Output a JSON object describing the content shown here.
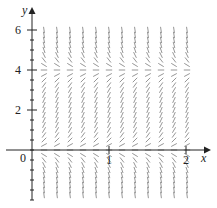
{
  "diagram": {
    "type": "slope-field",
    "axes": {
      "x_label": "x",
      "y_label": "y",
      "x_ticks": [
        {
          "value": 1,
          "label": "1"
        },
        {
          "value": 2,
          "label": "2"
        }
      ],
      "y_ticks": [
        {
          "value": 2,
          "label": "2"
        },
        {
          "value": 4,
          "label": "4"
        },
        {
          "value": 6,
          "label": "6"
        }
      ],
      "origin_label": "0"
    },
    "equilibria": [
      0,
      4
    ],
    "colors": {
      "axis": "#222222",
      "segment": "#8a8a8a"
    }
  }
}
